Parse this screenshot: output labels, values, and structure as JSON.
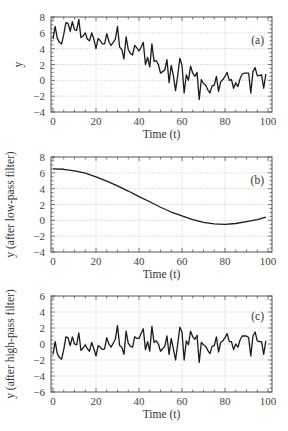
{
  "chart_data": [
    {
      "id": "a",
      "type": "line",
      "panel_label": "(a)",
      "title": "",
      "xlabel": "Time (t)",
      "ylabel": "y",
      "xlim": [
        0,
        100
      ],
      "ylim": [
        -4,
        8
      ],
      "xticks": [
        0,
        20,
        40,
        60,
        80,
        100
      ],
      "yticks": [
        -4,
        -2,
        0,
        2,
        4,
        6,
        8
      ],
      "grid": true,
      "series": [
        {
          "name": "y",
          "x": [
            0,
            1,
            2,
            3,
            4,
            5,
            6,
            7,
            8,
            9,
            10,
            11,
            12,
            13,
            14,
            15,
            16,
            17,
            18,
            19,
            20,
            21,
            22,
            23,
            24,
            25,
            26,
            27,
            28,
            29,
            30,
            31,
            32,
            33,
            34,
            35,
            36,
            37,
            38,
            39,
            40,
            41,
            42,
            43,
            44,
            45,
            46,
            47,
            48,
            49,
            50,
            51,
            52,
            53,
            54,
            55,
            56,
            57,
            58,
            59,
            60,
            61,
            62,
            63,
            64,
            65,
            66,
            67,
            68,
            69,
            70,
            71,
            72,
            73,
            74,
            75,
            76,
            77,
            78,
            79,
            80,
            81,
            82,
            83,
            84,
            85,
            86,
            87,
            88,
            89,
            90,
            91,
            92,
            93,
            94,
            95,
            96,
            97,
            98,
            99
          ],
          "values": [
            5.2,
            6.8,
            5.3,
            4.8,
            4.6,
            5.8,
            7.3,
            7.2,
            6.2,
            7.4,
            6.4,
            6.3,
            7.7,
            5.4,
            5.6,
            6.0,
            5.2,
            5.0,
            6.0,
            5.2,
            4.0,
            5.3,
            5.0,
            4.6,
            4.6,
            5.9,
            4.9,
            4.4,
            4.8,
            5.2,
            6.8,
            4.2,
            3.9,
            2.7,
            5.5,
            3.9,
            3.4,
            3.2,
            4.4,
            4.1,
            3.7,
            4.2,
            4.8,
            2.0,
            2.9,
            1.7,
            4.6,
            2.4,
            2.5,
            2.0,
            0.9,
            1.1,
            1.3,
            2.6,
            -0.3,
            1.9,
            0.6,
            -1.3,
            0.6,
            2.8,
            1.9,
            -1.6,
            0.7,
            0.0,
            1.8,
            0.9,
            0.5,
            1.0,
            -2.4,
            0.1,
            -0.4,
            -0.6,
            -1.2,
            -1.6,
            -0.7,
            -0.6,
            0.5,
            -1.4,
            -0.2,
            0.1,
            0.5,
            1.0,
            0.0,
            0.1,
            -1.0,
            -0.3,
            -0.8,
            0.2,
            0.8,
            0.9,
            0.9,
            0.9,
            -1.6,
            1.1,
            1.6,
            0.6,
            0.6,
            0.7,
            -1.0,
            0.8
          ]
        }
      ]
    },
    {
      "id": "b",
      "type": "line",
      "panel_label": "(b)",
      "title": "",
      "xlabel": "Time (t)",
      "ylabel": "y (after low-pass filter)",
      "xlim": [
        0,
        100
      ],
      "ylim": [
        -4,
        8
      ],
      "xticks": [
        0,
        20,
        40,
        60,
        80,
        100
      ],
      "yticks": [
        -4,
        -2,
        0,
        2,
        4,
        6,
        8
      ],
      "grid": true,
      "series": [
        {
          "name": "y low-pass",
          "x": [
            0,
            5,
            10,
            15,
            20,
            25,
            30,
            35,
            40,
            45,
            50,
            55,
            60,
            65,
            70,
            75,
            80,
            85,
            90,
            95,
            99
          ],
          "values": [
            6.5,
            6.45,
            6.25,
            5.95,
            5.5,
            4.95,
            4.35,
            3.7,
            3.0,
            2.35,
            1.65,
            1.05,
            0.55,
            0.1,
            -0.25,
            -0.45,
            -0.5,
            -0.4,
            -0.15,
            0.1,
            0.4
          ]
        }
      ]
    },
    {
      "id": "c",
      "type": "line",
      "panel_label": "(c)",
      "title": "",
      "xlabel": "Time (t)",
      "ylabel": "y (after high-pass filter)",
      "xlim": [
        0,
        100
      ],
      "ylim": [
        -6,
        6
      ],
      "xticks": [
        0,
        20,
        40,
        60,
        80,
        100
      ],
      "yticks": [
        -6,
        -4,
        -2,
        0,
        2,
        4,
        6
      ],
      "grid": true,
      "series": [
        {
          "name": "y high-pass",
          "x": [
            0,
            1,
            2,
            3,
            4,
            5,
            6,
            7,
            8,
            9,
            10,
            11,
            12,
            13,
            14,
            15,
            16,
            17,
            18,
            19,
            20,
            21,
            22,
            23,
            24,
            25,
            26,
            27,
            28,
            29,
            30,
            31,
            32,
            33,
            34,
            35,
            36,
            37,
            38,
            39,
            40,
            41,
            42,
            43,
            44,
            45,
            46,
            47,
            48,
            49,
            50,
            51,
            52,
            53,
            54,
            55,
            56,
            57,
            58,
            59,
            60,
            61,
            62,
            63,
            64,
            65,
            66,
            67,
            68,
            69,
            70,
            71,
            72,
            73,
            74,
            75,
            76,
            77,
            78,
            79,
            80,
            81,
            82,
            83,
            84,
            85,
            86,
            87,
            88,
            89,
            90,
            91,
            92,
            93,
            94,
            95,
            96,
            97,
            98,
            99
          ],
          "values": [
            -1.3,
            0.3,
            -1.2,
            -1.7,
            -1.9,
            -0.7,
            0.9,
            0.8,
            -0.2,
            0.9,
            0.0,
            -0.1,
            1.4,
            -0.8,
            -0.5,
            -0.1,
            -0.6,
            -0.9,
            0.2,
            -0.6,
            -1.5,
            -0.2,
            -0.4,
            -0.7,
            -0.6,
            0.8,
            0.0,
            -0.4,
            0.1,
            0.6,
            2.3,
            -0.2,
            -0.4,
            -1.3,
            1.6,
            0.1,
            -0.3,
            -0.4,
            0.9,
            0.7,
            0.7,
            1.3,
            1.9,
            -0.7,
            0.3,
            -0.9,
            2.2,
            0.2,
            0.4,
            0.0,
            -0.9,
            -0.6,
            -0.3,
            1.0,
            -1.3,
            0.7,
            -0.6,
            -2.0,
            0.0,
            2.1,
            1.5,
            -2.0,
            0.4,
            -0.1,
            1.6,
            0.9,
            0.6,
            1.1,
            -2.3,
            0.2,
            -0.1,
            -0.3,
            -0.8,
            -1.2,
            -0.3,
            -0.2,
            0.9,
            -1.0,
            0.2,
            0.4,
            0.8,
            1.3,
            0.3,
            0.3,
            -0.7,
            0.0,
            -0.4,
            0.5,
            1.0,
            1.0,
            1.0,
            0.8,
            -1.5,
            1.0,
            1.5,
            0.4,
            0.3,
            0.3,
            -1.3,
            0.4
          ]
        }
      ]
    }
  ]
}
